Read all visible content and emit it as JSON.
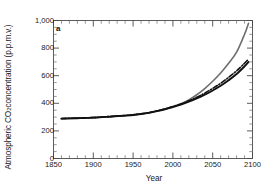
{
  "figure": {
    "panel_letter": "a",
    "ylabel_prefix": "Atmospheric CO",
    "ylabel_sub": "2",
    "ylabel_suffix": " concentration (p.p.m.v.)",
    "xlabel": "Year"
  },
  "chart_data": {
    "type": "line",
    "title": "",
    "panel_label": "a",
    "xlabel": "Year",
    "ylabel": "Atmospheric CO2 concentration (p.p.m.v.)",
    "xlim": [
      1850,
      2100
    ],
    "ylim": [
      0,
      1000
    ],
    "xticks": [
      1850,
      1900,
      1950,
      2000,
      2050,
      2100
    ],
    "xtick_labels": [
      "1850",
      "1900",
      "1950",
      "2000",
      "2050",
      "2100"
    ],
    "yticks": [
      0,
      200,
      400,
      600,
      800,
      1000
    ],
    "ytick_labels": [
      "0",
      "200",
      "400",
      "600",
      "800",
      "1,000"
    ],
    "minor_ticks": true,
    "grid": false,
    "legend": "none",
    "frame": "box",
    "series": [
      {
        "name": "high-emissions-scenario",
        "style": "solid",
        "color": "#6e6e6e",
        "width": 1.6,
        "x": [
          1860,
          1880,
          1900,
          1920,
          1940,
          1950,
          1960,
          1970,
          1980,
          1990,
          2000,
          2010,
          2020,
          2030,
          2040,
          2050,
          2060,
          2070,
          2080,
          2090,
          2095
        ],
        "y": [
          288,
          292,
          296,
          303,
          311,
          315,
          322,
          332,
          344,
          358,
          375,
          396,
          425,
          462,
          507,
          560,
          620,
          690,
          770,
          900,
          980
        ]
      },
      {
        "name": "mid-scenario-dash-dot",
        "style": "dashdot",
        "color": "#111111",
        "width": 1.6,
        "x": [
          1860,
          1880,
          1900,
          1920,
          1940,
          1950,
          1960,
          1970,
          1980,
          1990,
          2000,
          2010,
          2020,
          2030,
          2040,
          2050,
          2060,
          2070,
          2080,
          2090,
          2095
        ],
        "y": [
          290,
          293,
          297,
          304,
          312,
          317,
          324,
          333,
          345,
          359,
          376,
          395,
          418,
          444,
          474,
          508,
          545,
          588,
          635,
          690,
          720
        ]
      },
      {
        "name": "low-scenario-solid-black",
        "style": "solid",
        "color": "#111111",
        "width": 1.9,
        "x": [
          1860,
          1880,
          1900,
          1920,
          1940,
          1950,
          1960,
          1970,
          1980,
          1990,
          2000,
          2010,
          2020,
          2030,
          2040,
          2050,
          2060,
          2070,
          2080,
          2090,
          2095
        ],
        "y": [
          289,
          292,
          296,
          303,
          311,
          315,
          322,
          331,
          343,
          357,
          373,
          391,
          412,
          436,
          463,
          493,
          527,
          567,
          612,
          668,
          700
        ]
      }
    ]
  }
}
